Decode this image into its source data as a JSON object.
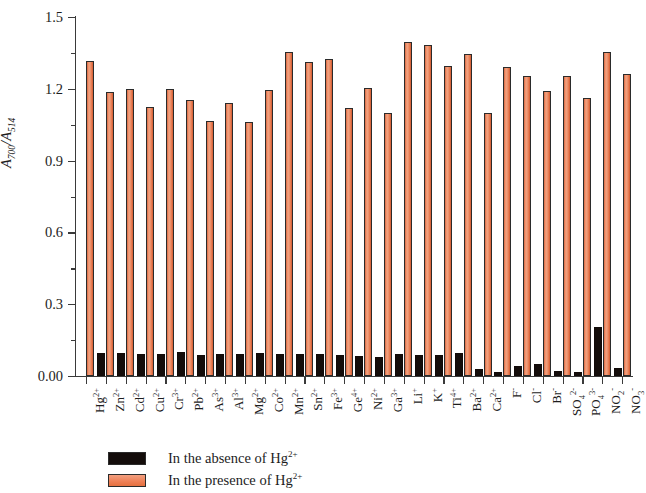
{
  "chart_data": {
    "type": "bar",
    "title": "",
    "xlabel": "",
    "ylabel": "A700/A514",
    "ylabel_parts": {
      "base1": "A",
      "sub1": "700",
      "sep": "/",
      "base2": "A",
      "sub2": "514"
    },
    "ylim": [
      0.0,
      1.5
    ],
    "yticks": [
      "0.00",
      "0.3",
      "0.6",
      "0.9",
      "1.2",
      "1.5"
    ],
    "ytick_values": [
      0.0,
      0.3,
      0.6,
      0.9,
      1.2,
      1.5
    ],
    "yminor_values": [
      0.15,
      0.45,
      0.75,
      1.05,
      1.35
    ],
    "grid": false,
    "legend_position": "below-left",
    "categories": [
      "Hg2+",
      "Zn2+",
      "Cd2+",
      "Cu2+",
      "Cr3+",
      "Pb2+",
      "As3+",
      "Al3+",
      "Mg2+",
      "Co2+",
      "Mn2+",
      "Sn2+",
      "Fe3+",
      "Ge4+",
      "Ni2+",
      "Ga3+",
      "Li+",
      "K+",
      "Ti4+",
      "Ba2+",
      "Ca2+",
      "F-",
      "Cl-",
      "Br-",
      "SO42-",
      "PO43-",
      "NO2-",
      "NO3-"
    ],
    "category_labels": [
      {
        "base": "Hg",
        "sup": "2+",
        "sub": ""
      },
      {
        "base": "Zn",
        "sup": "2+",
        "sub": ""
      },
      {
        "base": "Cd",
        "sup": "2+",
        "sub": ""
      },
      {
        "base": "Cu",
        "sup": "2+",
        "sub": ""
      },
      {
        "base": "Cr",
        "sup": "3+",
        "sub": ""
      },
      {
        "base": "Pb",
        "sup": "2+",
        "sub": ""
      },
      {
        "base": "As",
        "sup": "3+",
        "sub": ""
      },
      {
        "base": "Al",
        "sup": "3+",
        "sub": ""
      },
      {
        "base": "Mg",
        "sup": "2+",
        "sub": ""
      },
      {
        "base": "Co",
        "sup": "2+",
        "sub": ""
      },
      {
        "base": "Mn",
        "sup": "2+",
        "sub": ""
      },
      {
        "base": "Sn",
        "sup": "2+",
        "sub": ""
      },
      {
        "base": "Fe",
        "sup": "3+",
        "sub": ""
      },
      {
        "base": "Ge",
        "sup": "4+",
        "sub": ""
      },
      {
        "base": "Ni",
        "sup": "2+",
        "sub": ""
      },
      {
        "base": "Ga",
        "sup": "3+",
        "sub": ""
      },
      {
        "base": "Li",
        "sup": "+",
        "sub": ""
      },
      {
        "base": "K",
        "sup": "+",
        "sub": ""
      },
      {
        "base": "Ti",
        "sup": "4+",
        "sub": ""
      },
      {
        "base": "Ba",
        "sup": "2+",
        "sub": ""
      },
      {
        "base": "Ca",
        "sup": "2+",
        "sub": ""
      },
      {
        "base": "F",
        "sup": "-",
        "sub": ""
      },
      {
        "base": "Cl",
        "sup": "-",
        "sub": ""
      },
      {
        "base": "Br",
        "sup": "-",
        "sub": ""
      },
      {
        "base": "SO",
        "sup": "2-",
        "sub": "4"
      },
      {
        "base": "PO",
        "sup": "3-",
        "sub": "4"
      },
      {
        "base": "NO",
        "sup": "-",
        "sub": "2"
      },
      {
        "base": "NO",
        "sup": "-",
        "sub": "3"
      }
    ],
    "series": [
      {
        "name": "In the absence of Hg2+",
        "color": "#140d0b",
        "values": [
          0.0,
          0.095,
          0.095,
          0.09,
          0.09,
          0.1,
          0.088,
          0.09,
          0.092,
          0.098,
          0.092,
          0.09,
          0.09,
          0.088,
          0.082,
          0.078,
          0.092,
          0.088,
          0.088,
          0.098,
          0.03,
          0.018,
          0.042,
          0.05,
          0.022,
          0.018,
          0.205,
          0.035
        ]
      },
      {
        "name": "In the presence of Hg2+",
        "color": "#ee7f55",
        "values": [
          1.315,
          1.185,
          1.2,
          1.125,
          1.2,
          1.155,
          1.065,
          1.14,
          1.06,
          1.195,
          1.355,
          1.31,
          1.325,
          1.12,
          1.205,
          1.1,
          1.395,
          1.385,
          1.295,
          1.345,
          1.1,
          1.29,
          1.255,
          1.19,
          1.255,
          1.16,
          1.355,
          1.26
        ]
      }
    ],
    "last_value": 1.195
  },
  "legend": {
    "items": [
      {
        "swatch": "absence",
        "base": "In the absence of Hg",
        "sup": "2+"
      },
      {
        "swatch": "presence",
        "base": "In the presence of Hg",
        "sup": "2+"
      }
    ]
  }
}
